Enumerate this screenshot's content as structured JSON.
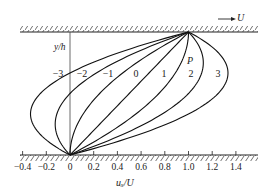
{
  "figure": {
    "top_wall_label": "U",
    "y_axis_label": "y/h",
    "x_axis_label": "uₓ/U",
    "parameter_label": "P"
  },
  "chart_data": {
    "type": "line",
    "title": "",
    "xlabel": "uₓ/U",
    "ylabel": "y/h",
    "xlim": [
      -0.4,
      1.5
    ],
    "ylim": [
      0,
      1
    ],
    "grid": false,
    "x_ticks": [
      "-0.4",
      "-0.2",
      "0",
      "0.2",
      "0.4",
      "0.6",
      "0.8",
      "1.0",
      "1.2",
      "1.4"
    ],
    "formula": "u/U = y/h + P*(y/h)*(1 - y/h)",
    "series": [
      {
        "name": "-3",
        "P": -3,
        "y": [
          0,
          0.1667,
          0.3333,
          0.5,
          0.6667,
          0.8333,
          1
        ],
        "x": [
          0,
          -0.25,
          -0.333,
          -0.25,
          0,
          0.417,
          1
        ]
      },
      {
        "name": "-2",
        "P": -2,
        "y": [
          0,
          0.1667,
          0.3333,
          0.5,
          0.6667,
          0.8333,
          1
        ],
        "x": [
          0,
          -0.111,
          -0.111,
          0,
          0.222,
          0.556,
          1
        ]
      },
      {
        "name": "-1",
        "P": -1,
        "y": [
          0,
          0.1667,
          0.3333,
          0.5,
          0.6667,
          0.8333,
          1
        ],
        "x": [
          0,
          0.028,
          0.111,
          0.25,
          0.444,
          0.694,
          1
        ]
      },
      {
        "name": "0",
        "P": 0,
        "y": [
          0,
          0.1667,
          0.3333,
          0.5,
          0.6667,
          0.8333,
          1
        ],
        "x": [
          0,
          0.1667,
          0.3333,
          0.5,
          0.6667,
          0.8333,
          1
        ]
      },
      {
        "name": "1",
        "P": 1,
        "y": [
          0,
          0.1667,
          0.3333,
          0.5,
          0.6667,
          0.8333,
          1
        ],
        "x": [
          0,
          0.306,
          0.556,
          0.75,
          0.889,
          0.972,
          1
        ]
      },
      {
        "name": "2",
        "P": 2,
        "y": [
          0,
          0.1667,
          0.3333,
          0.5,
          0.6667,
          0.8333,
          1
        ],
        "x": [
          0,
          0.444,
          0.778,
          1.0,
          1.111,
          1.111,
          1
        ]
      },
      {
        "name": "3",
        "P": 3,
        "y": [
          0,
          0.1667,
          0.3333,
          0.5,
          0.6667,
          0.8333,
          1
        ],
        "x": [
          0,
          0.583,
          1.0,
          1.25,
          1.333,
          1.25,
          1
        ]
      }
    ],
    "annotations": [
      "P",
      "→ U"
    ]
  }
}
